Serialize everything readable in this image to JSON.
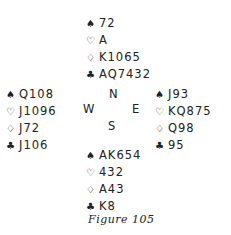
{
  "figure": {
    "caption": "Figure 105",
    "suit_icons": {
      "spade": "♠",
      "heart": "♡",
      "diamond": "♢",
      "club": "♣"
    },
    "hands": {
      "north": {
        "spades": "72",
        "hearts": "A",
        "diamonds": "K1065",
        "clubs": "AQ7432"
      },
      "west": {
        "spades": "Q108",
        "hearts": "J1096",
        "diamonds": "J72",
        "clubs": "J106"
      },
      "east": {
        "spades": "J93",
        "hearts": "KQ875",
        "diamonds": "Q98",
        "clubs": "95"
      },
      "south": {
        "spades": "AK654",
        "hearts": "432",
        "diamonds": "A43",
        "clubs": "K8"
      }
    },
    "compass": {
      "n": "N",
      "w": "W",
      "e": "E",
      "s": "S"
    }
  }
}
